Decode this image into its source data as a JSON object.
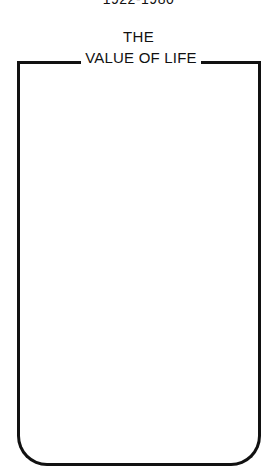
{
  "header": {
    "dates": "1922-1980",
    "title_line1": "THE",
    "title_line2": "VALUE OF LIFE"
  },
  "frame": {
    "border_color": "#111111",
    "content": ""
  }
}
